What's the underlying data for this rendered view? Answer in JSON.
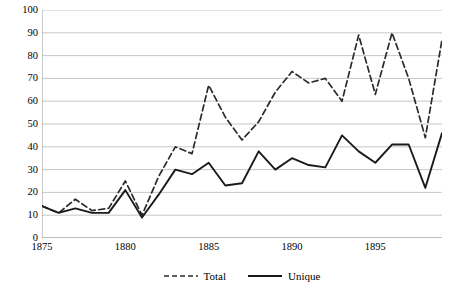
{
  "chart_data": {
    "type": "line",
    "title": "",
    "subtitle": "",
    "xlabel": "",
    "ylabel": "",
    "xlim": [
      1875,
      1899
    ],
    "ylim": [
      0,
      100
    ],
    "grid": "horizontal",
    "legend_position": "bottom",
    "x": [
      1875,
      1876,
      1877,
      1878,
      1879,
      1880,
      1881,
      1882,
      1883,
      1884,
      1885,
      1886,
      1887,
      1888,
      1889,
      1890,
      1891,
      1892,
      1893,
      1894,
      1895,
      1896,
      1897,
      1898,
      1899
    ],
    "x_ticks": [
      1875,
      1880,
      1885,
      1890,
      1895
    ],
    "y_ticks": [
      0,
      10,
      20,
      30,
      40,
      50,
      60,
      70,
      80,
      90,
      100
    ],
    "series": [
      {
        "name": "Total",
        "style": "dashed",
        "color": "#2b2b2b",
        "values": [
          14,
          11,
          17,
          12,
          13,
          25,
          10,
          27,
          40,
          37,
          67,
          53,
          43,
          51,
          64,
          73,
          68,
          70,
          60,
          89,
          63,
          90,
          70,
          44,
          87
        ]
      },
      {
        "name": "Unique",
        "style": "solid",
        "color": "#1a1a1a",
        "values": [
          14,
          11,
          13,
          11,
          11,
          21,
          9,
          19,
          30,
          28,
          33,
          23,
          24,
          38,
          30,
          35,
          32,
          31,
          45,
          38,
          33,
          41,
          41,
          22,
          46
        ]
      }
    ]
  },
  "legend": {
    "items": [
      {
        "label": "Total",
        "style": "dashed"
      },
      {
        "label": "Unique",
        "style": "solid"
      }
    ]
  },
  "axes": {
    "y_labels": [
      "100",
      "90",
      "80",
      "70",
      "60",
      "50",
      "40",
      "30",
      "20",
      "10",
      "0"
    ],
    "x_labels": [
      "1875",
      "1880",
      "1885",
      "1890",
      "1895"
    ]
  }
}
